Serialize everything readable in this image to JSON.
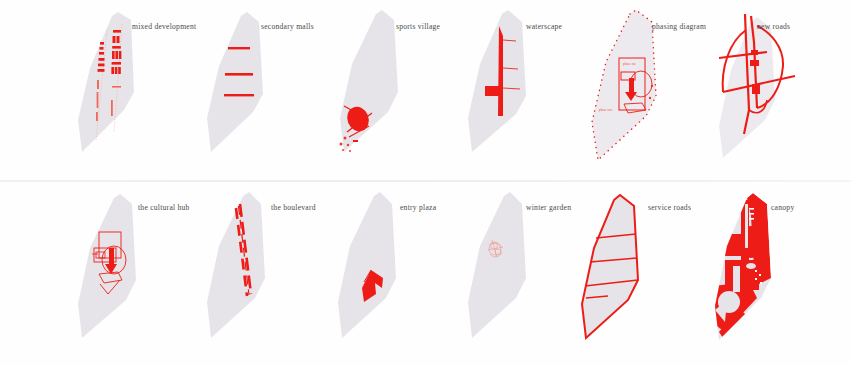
{
  "figure": {
    "layout": {
      "rows": 2,
      "columns": 6
    },
    "palette": {
      "site_fill": "#e6e4e9",
      "accent_red": "#ed1c16",
      "accent_red_light": "#f06a5c",
      "caption_color": "#4a4a4d",
      "background": "#ffffff",
      "divider": "#ececef"
    }
  },
  "rows": [
    {
      "name": "top-row",
      "panels": [
        {
          "id": "mixed-development",
          "label": "mixed development",
          "caption_x": 80
        },
        {
          "id": "secondary-malls",
          "label": "secondary malls",
          "caption_x": 78
        },
        {
          "id": "sports-village",
          "label": "sports village",
          "caption_x": 82
        },
        {
          "id": "waterscape",
          "label": "waterscape",
          "caption_x": 82
        },
        {
          "id": "phasing-diagram",
          "label": "phasing diagram",
          "caption_x": 80
        },
        {
          "id": "new-roads",
          "label": "new roads",
          "caption_x": 86
        }
      ]
    },
    {
      "name": "bottom-row",
      "panels": [
        {
          "id": "the-cultural-hub",
          "label": "the cultural hub",
          "caption_x": 82
        },
        {
          "id": "the-boulevard",
          "label": "the boulevard",
          "caption_x": 86
        },
        {
          "id": "entry-plaza",
          "label": "entry plaza",
          "caption_x": 86
        },
        {
          "id": "winter-garden",
          "label": "winter garden",
          "caption_x": 82
        },
        {
          "id": "service-roads",
          "label": "service roads",
          "caption_x": 80
        },
        {
          "id": "canopy",
          "label": "canopy",
          "caption_x": 92
        }
      ]
    }
  ],
  "annotations": {
    "phasing": {
      "phase_one_label": "phase one",
      "phase_two_label": "phase two"
    }
  }
}
